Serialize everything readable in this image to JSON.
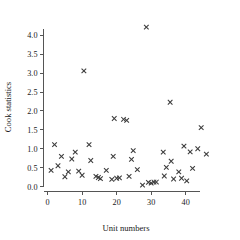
{
  "chart_data": {
    "type": "scatter",
    "title": "",
    "xlabel": "Unit numbers",
    "ylabel": "Cook statistics",
    "xlim": [
      -1.2,
      48.5
    ],
    "ylim": [
      -0.13,
      4.42
    ],
    "xticks": [
      0,
      10,
      20,
      30,
      40
    ],
    "xticklabels": [
      "0",
      "10",
      "20",
      "30",
      "40"
    ],
    "yticks": [
      0.0,
      0.5,
      1.0,
      1.5,
      2.0,
      2.5,
      3.0,
      3.5,
      4.0
    ],
    "yticklabels": [
      "0.0",
      "0.5",
      "1.0",
      "1.5",
      "2.0",
      "2.5",
      "3.0",
      "3.5",
      "4.0"
    ],
    "grid": false,
    "legend": null,
    "marker": "x",
    "marker_color": "#3b3b3b",
    "x": [
      1,
      2,
      3,
      4,
      5,
      6,
      7,
      8,
      9,
      10,
      11,
      12,
      13,
      14,
      15,
      16,
      17,
      18,
      19,
      20,
      21,
      22,
      23,
      24,
      25,
      26,
      27,
      28,
      29,
      30,
      31,
      32,
      33,
      34,
      35,
      36,
      37,
      38,
      39,
      40,
      41,
      42,
      43,
      44,
      45,
      46
    ],
    "y": [
      0.43,
      1.11,
      0.55,
      0.8,
      0.26,
      0.39,
      0.73,
      0.91,
      0.41,
      0.3,
      3.06,
      1.11,
      0.69,
      0.27,
      0.24,
      0.21,
      0.43,
      0.19,
      0.8,
      0.22,
      0.23,
      1.8,
      1.78,
      1.75,
      0.27,
      0.95,
      0.72,
      0.45,
      4.22,
      0.04,
      0.11,
      0.09,
      0.12,
      0.91,
      0.28,
      0.51,
      2.23,
      0.67,
      0.2,
      0.39,
      0.22,
      1.07,
      0.15,
      0.92,
      0.48,
      1.0,
      1.56,
      0.86
    ],
    "points": [
      {
        "x": 1,
        "y": 0.43
      },
      {
        "x": 2,
        "y": 1.11
      },
      {
        "x": 3,
        "y": 0.55
      },
      {
        "x": 4,
        "y": 0.8
      },
      {
        "x": 5,
        "y": 0.26
      },
      {
        "x": 6,
        "y": 0.39
      },
      {
        "x": 7,
        "y": 0.73
      },
      {
        "x": 8,
        "y": 0.91
      },
      {
        "x": 9,
        "y": 0.41
      },
      {
        "x": 10,
        "y": 0.3
      },
      {
        "x": 10.5,
        "y": 3.06
      },
      {
        "x": 12,
        "y": 1.11
      },
      {
        "x": 12.5,
        "y": 0.69
      },
      {
        "x": 14,
        "y": 0.27
      },
      {
        "x": 14.7,
        "y": 0.24
      },
      {
        "x": 15.3,
        "y": 0.21
      },
      {
        "x": 17,
        "y": 0.43
      },
      {
        "x": 18.6,
        "y": 0.19
      },
      {
        "x": 19,
        "y": 0.8
      },
      {
        "x": 19.3,
        "y": 1.8
      },
      {
        "x": 20,
        "y": 0.22
      },
      {
        "x": 20.8,
        "y": 0.23
      },
      {
        "x": 22,
        "y": 1.78
      },
      {
        "x": 22.9,
        "y": 1.75
      },
      {
        "x": 23.6,
        "y": 0.27
      },
      {
        "x": 24.3,
        "y": 0.72
      },
      {
        "x": 24.8,
        "y": 0.95
      },
      {
        "x": 26,
        "y": 0.45
      },
      {
        "x": 27.5,
        "y": 0.04
      },
      {
        "x": 28.6,
        "y": 4.22
      },
      {
        "x": 29.2,
        "y": 0.11
      },
      {
        "x": 30,
        "y": 0.09
      },
      {
        "x": 30.8,
        "y": 0.12
      },
      {
        "x": 31.5,
        "y": 0.12
      },
      {
        "x": 33.5,
        "y": 0.91
      },
      {
        "x": 33.8,
        "y": 0.28
      },
      {
        "x": 34.4,
        "y": 0.51
      },
      {
        "x": 35.5,
        "y": 2.23
      },
      {
        "x": 35.8,
        "y": 0.67
      },
      {
        "x": 36.5,
        "y": 0.2
      },
      {
        "x": 38,
        "y": 0.39
      },
      {
        "x": 38.8,
        "y": 0.22
      },
      {
        "x": 39.5,
        "y": 1.07
      },
      {
        "x": 40.3,
        "y": 0.15
      },
      {
        "x": 41.3,
        "y": 0.92
      },
      {
        "x": 42,
        "y": 0.48
      },
      {
        "x": 43.5,
        "y": 1.0
      },
      {
        "x": 44.5,
        "y": 1.56
      },
      {
        "x": 46,
        "y": 0.86
      }
    ]
  },
  "axes": {
    "x_title": "Unit numbers",
    "y_title": "Cook statistics"
  }
}
